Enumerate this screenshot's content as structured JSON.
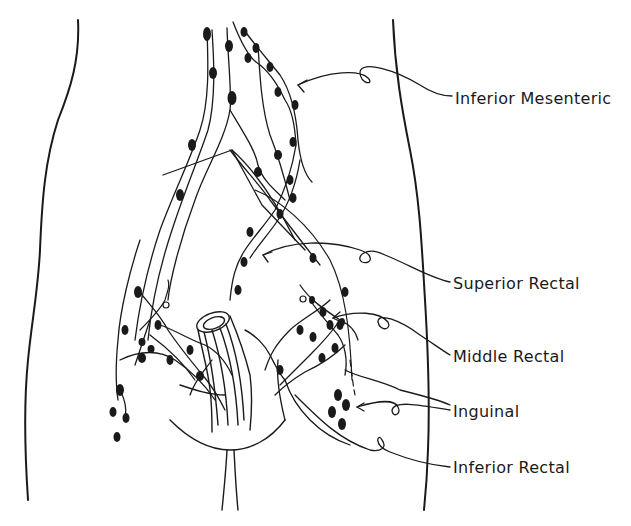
{
  "figure": {
    "colors": {
      "ink": "#1a1a1a",
      "background": "#ffffff"
    },
    "labels": [
      {
        "id": "inferior-mesenteric",
        "text": "Inferior Mesenteric"
      },
      {
        "id": "superior-rectal",
        "text": "Superior Rectal"
      },
      {
        "id": "middle-rectal",
        "text": "Middle Rectal"
      },
      {
        "id": "inguinal",
        "text": "Inguinal"
      },
      {
        "id": "inferior-rectal",
        "text": "Inferior Rectal"
      }
    ]
  }
}
